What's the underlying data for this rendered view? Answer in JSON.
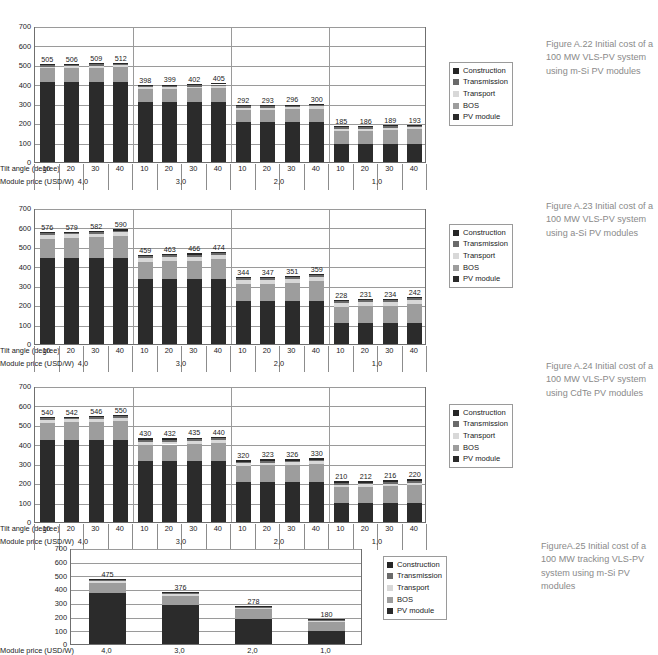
{
  "common": {
    "y_ticks": [
      700,
      600,
      500,
      400,
      300,
      200,
      100,
      0
    ],
    "ylim": [
      0,
      700
    ],
    "tilt_axis_title": "Tilt angle (degree)",
    "price_axis_title": "Module price (USD/W)",
    "tilt_values": [
      "10",
      "20",
      "30",
      "40"
    ],
    "price_groups": [
      "4,0",
      "3,0",
      "2,0",
      "1,0"
    ],
    "legend": [
      {
        "label": "Construction",
        "color": "#262626"
      },
      {
        "label": "Transmission",
        "color": "#6a6a6a"
      },
      {
        "label": "Transport",
        "color": "#d8d8d8"
      },
      {
        "label": "BOS",
        "color": "#9d9d9d"
      },
      {
        "label": "PV module",
        "color": "#2b2b2b"
      }
    ]
  },
  "figures": [
    {
      "id": "fig-a22",
      "caption": "Figure A.22 Initial cost of a 100 MW VLS-PV system using m-Si PV modules",
      "chart_data": {
        "type": "bar",
        "stacked": true,
        "title": "Initial cost of a 100 MW VLS-PV system using m-Si PV modules",
        "xlabel": "Tilt angle (degree) / Module price (USD/W)",
        "ylabel": "",
        "ylim": [
          0,
          700
        ],
        "yticks": [
          0,
          100,
          200,
          300,
          400,
          500,
          600,
          700
        ],
        "grid": true,
        "legend_position": "right",
        "group_labels": [
          "4,0",
          "3,0",
          "2,0",
          "1,0"
        ],
        "categories": [
          "10",
          "20",
          "30",
          "40",
          "10",
          "20",
          "30",
          "40",
          "10",
          "20",
          "30",
          "40",
          "10",
          "20",
          "30",
          "40"
        ],
        "totals": [
          505,
          506,
          509,
          512,
          398,
          399,
          402,
          405,
          292,
          293,
          296,
          300,
          185,
          186,
          189,
          193
        ],
        "series": [
          {
            "name": "PV module",
            "color": "#2b2b2b",
            "values": [
              410,
              410,
              410,
              410,
              307,
              307,
              307,
              307,
              205,
              205,
              205,
              205,
              95,
              95,
              95,
              95
            ]
          },
          {
            "name": "BOS",
            "color": "#9d9d9d",
            "values": [
              72,
              73,
              76,
              79,
              68,
              69,
              72,
              75,
              62,
              63,
              66,
              70,
              65,
              66,
              69,
              73
            ]
          },
          {
            "name": "Transport",
            "color": "#d8d8d8",
            "values": [
              9,
              9,
              9,
              9,
              9,
              9,
              9,
              9,
              11,
              11,
              11,
              11,
              11,
              11,
              11,
              11
            ]
          },
          {
            "name": "Transmission",
            "color": "#6a6a6a",
            "values": [
              8,
              8,
              8,
              8,
              8,
              8,
              8,
              8,
              8,
              8,
              8,
              8,
              8,
              8,
              8,
              8
            ]
          },
          {
            "name": "Construction",
            "color": "#262626",
            "values": [
              6,
              6,
              6,
              6,
              6,
              6,
              6,
              6,
              6,
              6,
              6,
              6,
              6,
              6,
              6,
              6
            ]
          }
        ]
      }
    },
    {
      "id": "fig-a23",
      "caption": "Figure A.23 Initial cost of a 100 MW VLS-PV system using a-Si PV modules",
      "chart_data": {
        "type": "bar",
        "stacked": true,
        "title": "Initial cost of a 100 MW VLS-PV system using a-Si PV modules",
        "xlabel": "Tilt angle (degree) / Module price (USD/W)",
        "ylabel": "",
        "ylim": [
          0,
          700
        ],
        "yticks": [
          0,
          100,
          200,
          300,
          400,
          500,
          600,
          700
        ],
        "grid": true,
        "legend_position": "right",
        "group_labels": [
          "4,0",
          "3,0",
          "2,0",
          "1,0"
        ],
        "categories": [
          "10",
          "20",
          "30",
          "40",
          "10",
          "20",
          "30",
          "40",
          "10",
          "20",
          "30",
          "40",
          "10",
          "20",
          "30",
          "40"
        ],
        "totals": [
          576,
          579,
          582,
          590,
          459,
          463,
          466,
          474,
          344,
          347,
          351,
          359,
          228,
          231,
          234,
          242
        ],
        "series": [
          {
            "name": "PV module",
            "color": "#2b2b2b",
            "values": [
              443,
              443,
              443,
              443,
              333,
              333,
              333,
              333,
              222,
              222,
              222,
              222,
              108,
              108,
              108,
              108
            ]
          },
          {
            "name": "BOS",
            "color": "#9d9d9d",
            "values": [
              100,
              103,
              106,
              114,
              89,
              93,
              96,
              104,
              85,
              88,
              92,
              100,
              83,
              86,
              89,
              97
            ]
          },
          {
            "name": "Transport",
            "color": "#d8d8d8",
            "values": [
              19,
              19,
              19,
              19,
              21,
              21,
              21,
              21,
              21,
              21,
              21,
              21,
              21,
              21,
              21,
              21
            ]
          },
          {
            "name": "Transmission",
            "color": "#6a6a6a",
            "values": [
              8,
              8,
              8,
              8,
              10,
              10,
              10,
              10,
              10,
              10,
              10,
              10,
              10,
              10,
              10,
              10
            ]
          },
          {
            "name": "Construction",
            "color": "#262626",
            "values": [
              6,
              6,
              6,
              6,
              6,
              6,
              6,
              6,
              6,
              6,
              6,
              6,
              6,
              6,
              6,
              6
            ]
          }
        ]
      }
    },
    {
      "id": "fig-a24",
      "caption": "Figure A.24 Initial cost of a 100 MW VLS-PV system using CdTe PV modules",
      "chart_data": {
        "type": "bar",
        "stacked": true,
        "title": "Initial cost of a 100 MW VLS-PV system using CdTe PV modules",
        "xlabel": "Tilt angle (degree) / Module price (USD/W)",
        "ylabel": "",
        "ylim": [
          0,
          700
        ],
        "yticks": [
          0,
          100,
          200,
          300,
          400,
          500,
          600,
          700
        ],
        "grid": true,
        "legend_position": "right",
        "group_labels": [
          "4,0",
          "3,0",
          "2,0",
          "1,0"
        ],
        "categories": [
          "10",
          "20",
          "30",
          "40",
          "10",
          "20",
          "30",
          "40",
          "10",
          "20",
          "30",
          "40",
          "10",
          "20",
          "30",
          "40"
        ],
        "totals": [
          540,
          542,
          546,
          550,
          430,
          432,
          435,
          440,
          320,
          323,
          326,
          330,
          210,
          212,
          216,
          220
        ],
        "series": [
          {
            "name": "PV module",
            "color": "#2b2b2b",
            "values": [
              420,
              420,
              420,
              420,
              313,
              313,
              313,
              313,
              208,
              208,
              208,
              208,
              97,
              97,
              97,
              97
            ]
          },
          {
            "name": "BOS",
            "color": "#9d9d9d",
            "values": [
              91,
              93,
              97,
              101,
              84,
              86,
              89,
              94,
              80,
              83,
              86,
              90,
              81,
              83,
              87,
              91
            ]
          },
          {
            "name": "Transport",
            "color": "#d8d8d8",
            "values": [
              15,
              15,
              15,
              15,
              15,
              15,
              15,
              15,
              14,
              14,
              14,
              14,
              14,
              14,
              14,
              14
            ]
          },
          {
            "name": "Transmission",
            "color": "#6a6a6a",
            "values": [
              8,
              8,
              8,
              8,
              8,
              8,
              8,
              8,
              8,
              8,
              8,
              8,
              8,
              8,
              8,
              8
            ]
          },
          {
            "name": "Construction",
            "color": "#262626",
            "values": [
              6,
              6,
              6,
              6,
              10,
              10,
              10,
              10,
              10,
              10,
              10,
              10,
              10,
              10,
              10,
              10
            ]
          }
        ]
      }
    },
    {
      "id": "fig-a25",
      "caption": "FigureA.25 Initial cost of a 100 MW tracking VLS-PV system using m-Si PV modules",
      "chart_data": {
        "type": "bar",
        "stacked": true,
        "title": "Initial cost of a 100 MW tracking VLS-PV system using m-Si PV modules",
        "xlabel": "Module price (USD/W)",
        "ylabel": "",
        "ylim": [
          0,
          700
        ],
        "yticks": [
          0,
          100,
          200,
          300,
          400,
          500,
          600,
          700
        ],
        "grid": true,
        "legend_position": "right",
        "group_labels": [
          "4,0",
          "3,0",
          "2,0",
          "1,0"
        ],
        "categories": [
          "4,0",
          "3,0",
          "2,0",
          "1,0"
        ],
        "totals": [
          475,
          376,
          278,
          180
        ],
        "series": [
          {
            "name": "PV module",
            "color": "#2b2b2b",
            "values": [
              375,
              281,
              186,
              92
            ]
          },
          {
            "name": "BOS",
            "color": "#9d9d9d",
            "values": [
              73,
              71,
              68,
              65
            ]
          },
          {
            "name": "Transport",
            "color": "#d8d8d8",
            "values": [
              13,
              10,
              12,
              11
            ]
          },
          {
            "name": "Transmission",
            "color": "#6a6a6a",
            "values": [
              8,
              8,
              6,
              6
            ]
          },
          {
            "name": "Construction",
            "color": "#262626",
            "values": [
              6,
              6,
              6,
              6
            ]
          }
        ]
      }
    }
  ]
}
